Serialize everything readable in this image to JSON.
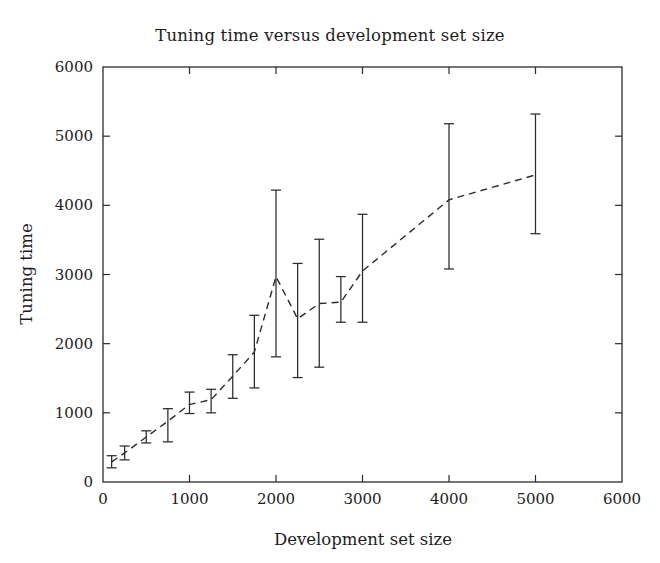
{
  "chart_data": {
    "type": "line",
    "title": "Tuning time versus development set size",
    "xlabel": "Development set size",
    "ylabel": "Tuning time",
    "xlim": [
      0,
      6000
    ],
    "ylim": [
      0,
      6000
    ],
    "xticks": [
      0,
      1000,
      2000,
      3000,
      4000,
      5000,
      6000
    ],
    "yticks": [
      0,
      1000,
      2000,
      3000,
      4000,
      5000,
      6000
    ],
    "xtick_labels": [
      "0",
      "1000",
      "2000",
      "3000",
      "4000",
      "5000",
      "6000"
    ],
    "ytick_labels": [
      "0",
      "1000",
      "2000",
      "3000",
      "4000",
      "5000",
      "6000"
    ],
    "grid": false,
    "legend": null,
    "line_style": "dashed",
    "marker": "errorbar",
    "series": [
      {
        "name": "Tuning time",
        "x": [
          100,
          250,
          500,
          750,
          1000,
          1250,
          1500,
          1750,
          2000,
          2250,
          2500,
          2750,
          3000,
          4000,
          5000
        ],
        "values": [
          290,
          420,
          650,
          880,
          1120,
          1190,
          1530,
          1880,
          2970,
          2360,
          2580,
          2600,
          3050,
          4080,
          4440
        ],
        "err_low": [
          205,
          320,
          565,
          580,
          990,
          1000,
          1210,
          1360,
          1810,
          1510,
          1660,
          2310,
          2310,
          3080,
          3590
        ],
        "err_high": [
          380,
          520,
          740,
          1060,
          1300,
          1340,
          1840,
          2410,
          4220,
          3160,
          3510,
          2970,
          3870,
          5180,
          5320
        ]
      }
    ]
  }
}
